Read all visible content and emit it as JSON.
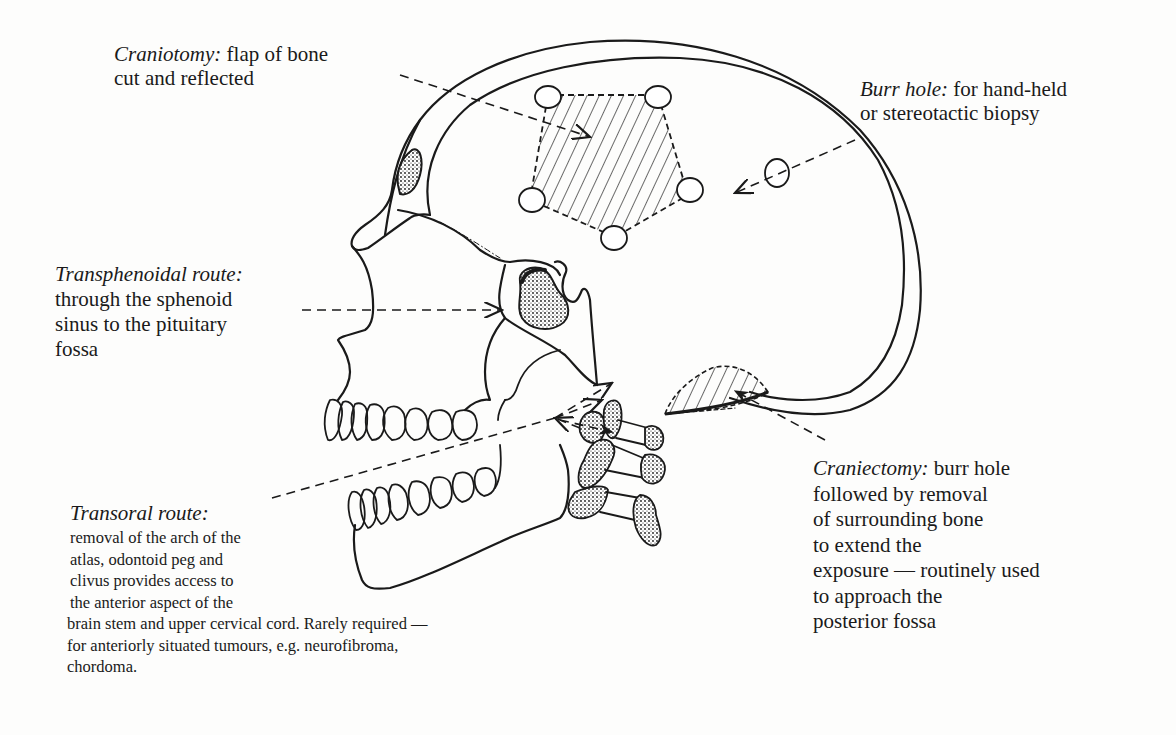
{
  "diagram": {
    "colors": {
      "ink": "#1a1a1a",
      "paper": "#fdfdfc"
    }
  },
  "labels": {
    "craniotomy": {
      "term": "Craniotomy:",
      "lines": [
        "flap of bone",
        "cut and reflected"
      ]
    },
    "burr_hole": {
      "term": "Burr hole:",
      "lines": [
        "for hand-held",
        "or stereotactic biopsy"
      ]
    },
    "transphenoidal": {
      "term": "Transphenoidal route:",
      "lines": [
        "through the sphenoid",
        "sinus to the pituitary",
        "fossa"
      ]
    },
    "transoral": {
      "term": "Transoral route:",
      "lines": [
        "removal of the arch of the",
        "atlas, odontoid peg and",
        "clivus provides access to",
        "the anterior aspect of the",
        "brain stem and upper cervical cord. Rarely required —",
        "for anteriorly situated tumours, e.g. neurofibroma,",
        "chordoma."
      ]
    },
    "craniectomy": {
      "term": "Craniectomy:",
      "lines": [
        "burr hole",
        "followed by removal",
        "of surrounding bone",
        "to extend the",
        "exposure — routinely used",
        "to approach the",
        "posterior fossa"
      ]
    }
  }
}
